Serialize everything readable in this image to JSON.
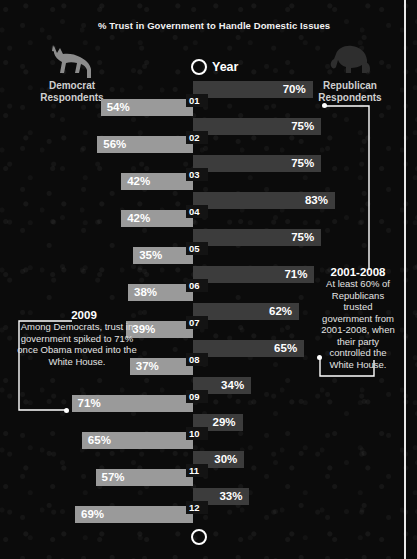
{
  "title": "% Trust in Government to Handle Domestic Issues",
  "axis": {
    "year_label": "Year"
  },
  "legend": {
    "democrat": {
      "icon": "donkey-icon",
      "line1": "Democrat",
      "line2": "Respondents",
      "color": "#9a9a9a"
    },
    "republican": {
      "icon": "elephant-icon",
      "line1": "Republican",
      "line2": "Respondents",
      "color": "#3c3c3c"
    }
  },
  "callouts": [
    {
      "id": "2009",
      "heading": "2009",
      "body": "Among Democrats, trust in government spiked to 71% once Obama moved into the White House."
    },
    {
      "id": "2001-2008",
      "heading": "2001-2008",
      "body": "At least 60% of Republicans trusted government from 2001-2008, when their party controlled the White House."
    }
  ],
  "chart_data": {
    "type": "bar",
    "title": "% Trust in Government to Handle Domestic Issues",
    "xlabel": "",
    "ylabel": "Year",
    "orientation": "horizontal-diverging",
    "categories": [
      "01",
      "02",
      "03",
      "04",
      "05",
      "06",
      "07",
      "08",
      "09",
      "10",
      "11",
      "12"
    ],
    "unit": "%",
    "xlim": [
      0,
      100
    ],
    "grid": false,
    "legend_position": "top",
    "series": [
      {
        "name": "Democrat Respondents",
        "side": "left",
        "color": "#9a9a9a",
        "values": [
          54,
          56,
          42,
          42,
          35,
          38,
          39,
          37,
          71,
          65,
          57,
          69
        ],
        "labels": [
          "54%",
          "56%",
          "42%",
          "42%",
          "35%",
          "38%",
          "39%",
          "37%",
          "71%",
          "65%",
          "57%",
          "69%"
        ]
      },
      {
        "name": "Republican Respondents",
        "side": "right",
        "color": "#3c3c3c",
        "values": [
          70,
          75,
          75,
          83,
          75,
          71,
          62,
          65,
          34,
          29,
          30,
          33
        ],
        "labels": [
          "70%",
          "75%",
          "75%",
          "83%",
          "75%",
          "71%",
          "62%",
          "65%",
          "34%",
          "29%",
          "30%",
          "33%"
        ]
      }
    ]
  }
}
